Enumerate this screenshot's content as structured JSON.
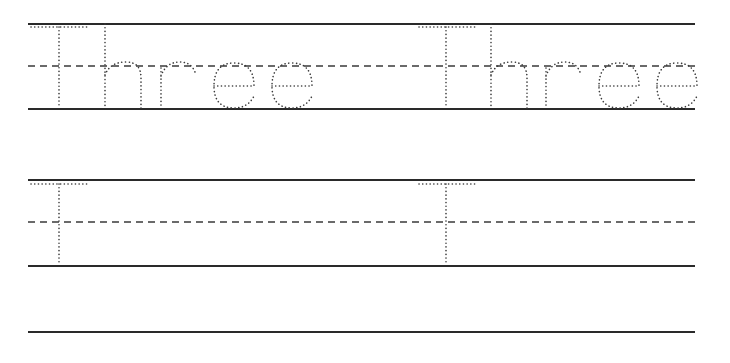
{
  "worksheet": {
    "word": "Three",
    "rows": [
      {
        "name": "row-1",
        "traced_words": [
          "Three",
          "Three"
        ],
        "type": "full-word-trace"
      },
      {
        "name": "row-2",
        "traced_words": [
          "T",
          "T"
        ],
        "type": "starting-letter-trace"
      },
      {
        "name": "row-3",
        "traced_words": [],
        "type": "blank-line"
      }
    ],
    "colors": {
      "line": "#2a2a2a",
      "dots": "#3a3a3a",
      "background": "#ffffff"
    }
  }
}
